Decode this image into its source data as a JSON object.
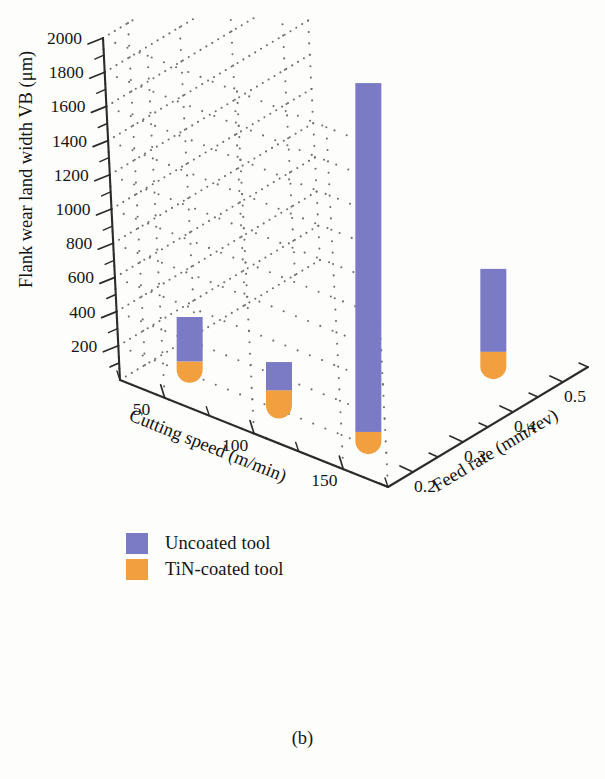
{
  "caption": "(b)",
  "legend": {
    "items": [
      {
        "label": "Uncoated tool",
        "color": "#7b7ac4",
        "key": "uncoated"
      },
      {
        "label": "TiN-coated tool",
        "color": "#f2a03f",
        "key": "tin"
      }
    ]
  },
  "axes": {
    "y": {
      "title": "Flank wear land width VB (μm)",
      "ticks": [
        "200",
        "400",
        "600",
        "800",
        "1000",
        "1200",
        "1400",
        "1600",
        "1800",
        "2000"
      ]
    },
    "x": {
      "title": "Cutting speed (m/min)",
      "ticks": [
        "50",
        "100",
        "150"
      ]
    },
    "z": {
      "title": "Feed rate (mm/rev)",
      "ticks": [
        "0.2",
        "0.3",
        "0.4",
        "0.5"
      ]
    }
  },
  "chart_data": {
    "type": "bar",
    "subtype": "3d-stacked-bar",
    "title": "",
    "xlabel": "Cutting speed (m/min)",
    "ylabel": "Flank wear land width VB (μm)",
    "zlabel": "Feed rate (mm/rev)",
    "ylim": [
      0,
      2000
    ],
    "ytick_step": 200,
    "xlim": [
      25,
      175
    ],
    "xticks": [
      50,
      100,
      150
    ],
    "zlim": [
      0.15,
      0.55
    ],
    "zticks": [
      0.2,
      0.3,
      0.4,
      0.5
    ],
    "grid": "dotted",
    "legend_position": "below-left",
    "series": [
      {
        "name": "Uncoated tool",
        "color": "#7b7ac4",
        "values": [
          385,
          330,
          2170,
          645
        ]
      },
      {
        "name": "TiN-coated tool",
        "color": "#f2a03f",
        "values": [
          125,
          165,
          130,
          160
        ]
      }
    ],
    "bars": [
      {
        "cutting_speed": 50,
        "feed_rate": 0.2,
        "uncoated": 385,
        "tin_coated": 125
      },
      {
        "cutting_speed": 100,
        "feed_rate": 0.2,
        "uncoated": 330,
        "tin_coated": 165
      },
      {
        "cutting_speed": 150,
        "feed_rate": 0.2,
        "uncoated": 2170,
        "tin_coated": 130
      },
      {
        "cutting_speed": 150,
        "feed_rate": 0.45,
        "uncoated": 645,
        "tin_coated": 160
      }
    ]
  }
}
